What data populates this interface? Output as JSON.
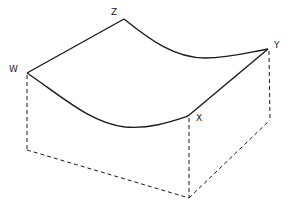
{
  "diagram": {
    "type": "isometric-surface-block",
    "labels": {
      "W": "W",
      "X": "X",
      "Y": "Y",
      "Z": "Z"
    },
    "colors": {
      "stroke": "#1a1a1a",
      "background": "#ffffff"
    }
  }
}
